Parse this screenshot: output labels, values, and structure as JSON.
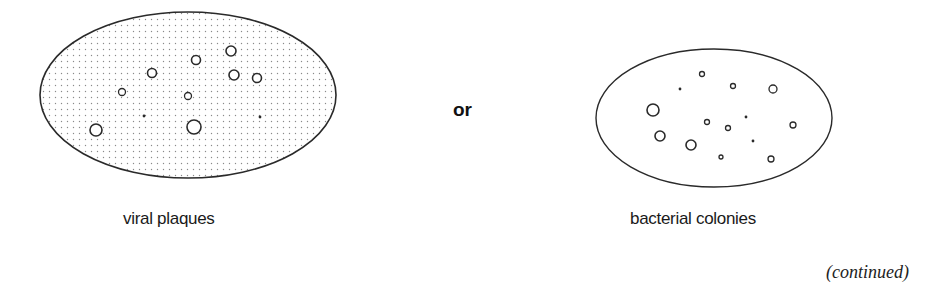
{
  "labels": {
    "left": "viral plaques",
    "middle": "or",
    "right": "bacterial colonies",
    "footer": "(continued)"
  },
  "colors": {
    "stroke": "#2a2a2a",
    "stipple": "#8a8a8a",
    "background": "#ffffff"
  },
  "dishes": [
    {
      "name": "viral-plaque-dish",
      "cx": 188,
      "cy": 95,
      "rx": 148,
      "ry": 83,
      "fill": "stippled",
      "rings": [
        {
          "x": 231,
          "y": 51,
          "r": 5
        },
        {
          "x": 196,
          "y": 60,
          "r": 4.5
        },
        {
          "x": 152,
          "y": 73,
          "r": 4.5
        },
        {
          "x": 234,
          "y": 75,
          "r": 5
        },
        {
          "x": 257,
          "y": 78,
          "r": 4.5
        },
        {
          "x": 122,
          "y": 92,
          "r": 3.5
        },
        {
          "x": 188,
          "y": 96,
          "r": 3.5
        },
        {
          "x": 96,
          "y": 130,
          "r": 6
        },
        {
          "x": 194,
          "y": 127,
          "r": 7
        }
      ],
      "dots": [
        {
          "x": 144,
          "y": 116
        },
        {
          "x": 260,
          "y": 117
        }
      ]
    },
    {
      "name": "bacterial-colony-dish",
      "cx": 714,
      "cy": 118,
      "rx": 118,
      "ry": 69,
      "fill": "plain",
      "rings": [
        {
          "x": 702,
          "y": 74,
          "r": 2.5
        },
        {
          "x": 733,
          "y": 86,
          "r": 2.5
        },
        {
          "x": 773,
          "y": 89,
          "r": 4
        },
        {
          "x": 653,
          "y": 110,
          "r": 6
        },
        {
          "x": 707,
          "y": 122,
          "r": 2.5
        },
        {
          "x": 728,
          "y": 128,
          "r": 2.5
        },
        {
          "x": 793,
          "y": 125,
          "r": 3
        },
        {
          "x": 660,
          "y": 136,
          "r": 5
        },
        {
          "x": 691,
          "y": 145,
          "r": 5
        },
        {
          "x": 721,
          "y": 157,
          "r": 2
        },
        {
          "x": 771,
          "y": 159,
          "r": 3
        }
      ],
      "dots": [
        {
          "x": 680,
          "y": 89
        },
        {
          "x": 746,
          "y": 117
        },
        {
          "x": 753,
          "y": 141
        }
      ]
    }
  ]
}
